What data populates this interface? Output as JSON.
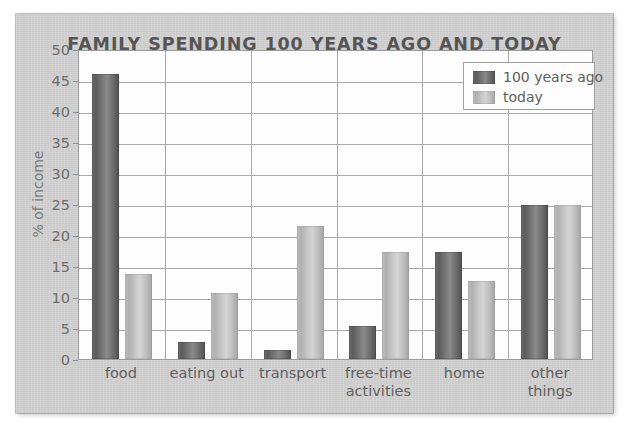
{
  "chart_data": {
    "type": "bar",
    "title": "FAMILY SPENDING 100 YEARS AGO AND TODAY",
    "xlabel": "",
    "ylabel": "% of income",
    "ylim": [
      0,
      50
    ],
    "ytick_step": 5,
    "yticks": [
      50,
      45,
      40,
      35,
      30,
      25,
      20,
      15,
      10,
      5,
      0
    ],
    "grid": true,
    "legend_position": "top-right",
    "categories": [
      "food",
      "eating out",
      "transport",
      "free-time activities",
      "home",
      "other things"
    ],
    "series": [
      {
        "name": "100 years ago",
        "color": "#6b6b6b",
        "values": [
          46.0,
          2.8,
          1.4,
          5.4,
          17.3,
          24.8
        ]
      },
      {
        "name": "today",
        "color": "#c0c0c0",
        "values": [
          13.7,
          10.7,
          21.4,
          17.3,
          12.6,
          24.8
        ]
      }
    ]
  },
  "legend": {
    "items": [
      {
        "label": "100 years ago"
      },
      {
        "label": "today"
      }
    ]
  },
  "colors": {
    "panel_background": "#d2d2d2",
    "plot_background": "#fdfdfd",
    "gridline": "#a8a8a8",
    "title_text": "#555555",
    "tick_text": "#6d6d6d",
    "series_old": "#6b6b6b",
    "series_today": "#c0c0c0"
  }
}
